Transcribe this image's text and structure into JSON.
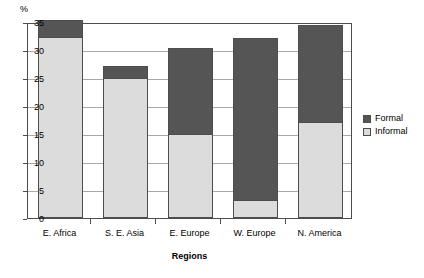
{
  "chart_data": {
    "type": "bar",
    "subtype": "stacked-bar",
    "title": "",
    "xlabel": "Regions",
    "ylabel": "",
    "y_unit_label": "%",
    "categories": [
      "E. Africa",
      "S. E. Asia",
      "E. Europe",
      "W. Europe",
      "N. America"
    ],
    "series": [
      {
        "name": "Informal",
        "color": "#dcdcdc",
        "values": [
          32.3,
          25.0,
          15.0,
          3.3,
          17.1
        ]
      },
      {
        "name": "Formal",
        "color": "#555555",
        "values": [
          3.1,
          2.1,
          15.3,
          28.9,
          17.3
        ]
      }
    ],
    "totals": [
      35.4,
      27.1,
      30.3,
      32.2,
      34.4
    ],
    "ylim": [
      0,
      35
    ],
    "yticks": [
      0,
      5,
      10,
      15,
      20,
      25,
      30,
      35
    ],
    "ytick_labels": [
      "0",
      "5",
      "10",
      "15",
      "20",
      "25",
      "30",
      "35"
    ],
    "grid": true,
    "grid_axis": "y",
    "legend_position": "right",
    "legend_entries": [
      {
        "label": "Formal",
        "color": "#555555"
      },
      {
        "label": "Informal",
        "color": "#dcdcdc"
      }
    ]
  },
  "colors": {
    "formal": "#555555",
    "informal": "#dcdcdc",
    "axis": "#4d4d4d",
    "grid": "#a8a8a8",
    "background": "#ffffff",
    "text": "#000000"
  }
}
